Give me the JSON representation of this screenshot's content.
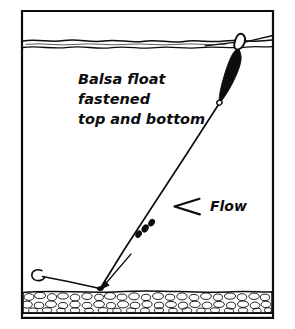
{
  "figure": {
    "name": "balsa-float-rig-diagram",
    "background_color": "#ffffff",
    "ink_color": "#0d0d0d",
    "frame": {
      "x": 22,
      "y": 11,
      "width": 251,
      "height": 307
    }
  },
  "annotations": {
    "float_caption": {
      "line1": "Balsa float",
      "line2": "fastened",
      "line3": "top and bottom",
      "x": 78,
      "y": 84
    },
    "flow_label": {
      "text": "Flow",
      "arrow_glyph": "left-arrow",
      "x": 212,
      "y": 211
    }
  },
  "elements": {
    "water_surface": {
      "name": "water-surface-line",
      "y_upper": 40,
      "y_lower": 47,
      "style": "wavy-double-line"
    },
    "river_bed": {
      "name": "gravel-river-bed",
      "y_top": 292,
      "y_bottom": 313,
      "baseline_y": 318,
      "texture": "pebbles"
    },
    "float": {
      "name": "balsa-float",
      "fill": "#0d0d0d",
      "top_ring_x": 243,
      "top_ring_y": 42,
      "tip_x": 219,
      "tip_y": 103,
      "fastening": "top and bottom"
    },
    "main_line": {
      "name": "fishing-line",
      "from_x": 219,
      "from_y": 103,
      "to_x": 100,
      "to_y": 288
    },
    "surface_line": {
      "name": "line-on-surface",
      "from_x": 243,
      "from_y": 42,
      "to_x": 273,
      "to_y": 36
    },
    "split_shot": {
      "name": "split-shot-weights",
      "count": 3,
      "positions": [
        {
          "x": 139,
          "y": 233
        },
        {
          "x": 145,
          "y": 228
        },
        {
          "x": 151,
          "y": 223
        }
      ]
    },
    "hook": {
      "name": "fishing-hook",
      "bend_x": 37,
      "bend_y": 274,
      "shank_end_x": 100,
      "shank_end_y": 288
    },
    "bed_pointer": {
      "name": "bed-pointer-arrow",
      "from_x": 128,
      "from_y": 258,
      "to_x": 100,
      "to_y": 289
    }
  }
}
